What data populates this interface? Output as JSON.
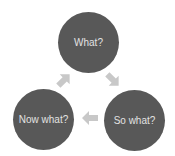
{
  "diagram": {
    "type": "cycle",
    "colors": {
      "node_fill": "#585858",
      "node_text": "#e2e2e2",
      "arrow": "#c8c8c8",
      "background": "#ffffff"
    },
    "nodes": [
      {
        "id": "what",
        "label": "What?"
      },
      {
        "id": "so-what",
        "label": "So what?"
      },
      {
        "id": "now-what",
        "label": "Now what?"
      }
    ],
    "edges": [
      {
        "from": "What?",
        "to": "So what?"
      },
      {
        "from": "So what?",
        "to": "Now what?"
      },
      {
        "from": "Now what?",
        "to": "What?"
      }
    ]
  }
}
